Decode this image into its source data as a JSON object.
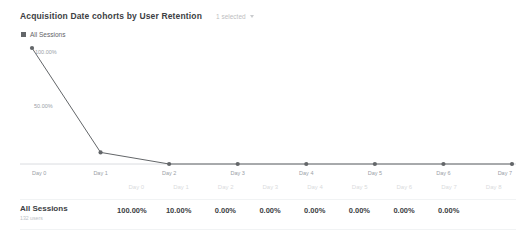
{
  "header": {
    "title": "Acquisition Date cohorts by User Retention",
    "metric_select_label": "1 selected",
    "chevron_icon": "chevron-down-icon"
  },
  "legend": {
    "items": [
      {
        "label": "All Sessions",
        "color": "#636669",
        "swatch_icon": "square-swatch-icon"
      }
    ]
  },
  "ghost_watermark": {
    "line1": " ",
    "line2": " "
  },
  "chart_data": {
    "type": "line",
    "title": "Acquisition Date cohorts by User Retention",
    "xlabel": "",
    "ylabel": "",
    "grid": false,
    "legend_position": "top-left",
    "x": [
      "Day 0",
      "Day 1",
      "Day 2",
      "Day 3",
      "Day 4",
      "Day 5",
      "Day 6",
      "Day 7"
    ],
    "ylim": [
      0,
      100
    ],
    "y_tick_labels": [
      "50.00%"
    ],
    "y_ticks": [
      50
    ],
    "point_labels": [
      "100.00%"
    ],
    "series": [
      {
        "name": "All Sessions",
        "color": "#636669",
        "values": [
          100.0,
          10.0,
          0.0,
          0.0,
          0.0,
          0.0,
          0.0,
          0.0
        ],
        "value_labels": [
          "100.00%",
          "10.00%",
          "0.00%",
          "0.00%",
          "0.00%",
          "0.00%",
          "0.00%",
          "0.00%"
        ]
      }
    ]
  },
  "table": {
    "columns": [
      "Day 0",
      "Day 1",
      "Day 2",
      "Day 3",
      "Day 4",
      "Day 5",
      "Day 6",
      "Day 7",
      "Day 8"
    ],
    "rows": [
      {
        "title": "All Sessions",
        "subtitle": "132 users",
        "values": [
          "100.00%",
          "10.00%",
          "0.00%",
          "0.00%",
          "0.00%",
          "0.00%",
          "0.00%",
          "0.00%",
          ""
        ]
      }
    ]
  }
}
